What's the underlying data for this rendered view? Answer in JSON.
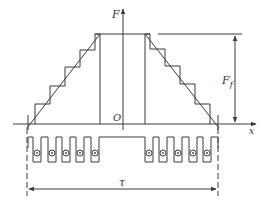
{
  "diagram": {
    "type": "mmf-distribution-staircase",
    "axes": {
      "vertical_label": "F",
      "horizontal_label": "x",
      "origin_label": "O"
    },
    "dimensions": {
      "amplitude_label": "F",
      "amplitude_subscript": "f",
      "pitch_label": "τ"
    },
    "slots": {
      "left_group_count": 5,
      "right_group_count": 5
    },
    "colors": {
      "line": "#3a3a3a",
      "background": "#ffffff"
    }
  }
}
